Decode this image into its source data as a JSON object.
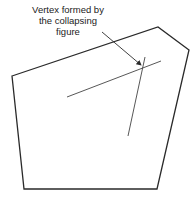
{
  "annotation": {
    "lines": [
      "Vertex formed by",
      "the collapsing",
      "figure"
    ]
  },
  "colors": {
    "stroke": "#2a2a2a",
    "background": "#ffffff"
  },
  "polygon": {
    "vertices": [
      [
        12,
        76
      ],
      [
        158,
        27
      ],
      [
        189,
        50
      ],
      [
        157,
        189
      ],
      [
        24,
        189
      ]
    ]
  }
}
